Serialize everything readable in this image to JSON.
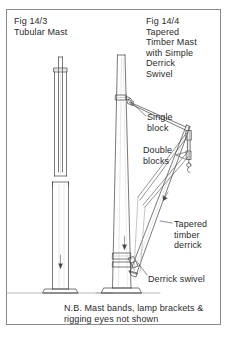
{
  "figure": {
    "border_color": "#8b8b8b",
    "line_color": "#404040",
    "text_color": "#2b2b2b",
    "background": "#ffffff"
  },
  "titles": {
    "left": "Fig 14/3\nTubular Mast",
    "right": "Fig 14/4\nTapered\nTimber Mast\nwith Simple\nDerrick\nSwivel"
  },
  "callouts": {
    "single_block": "Single\nblock",
    "double_blocks": "Double\nblocks",
    "tapered_derrick": "Tapered\ntimber\nderrick",
    "derrick_swivel": "Derrick swivel"
  },
  "note": "N.B. Mast bands, lamp brackets &\nrigging eyes not shown",
  "parts": {
    "tubular_mast": "tubular-mast-drawing",
    "timber_mast": "tapered-timber-mast-drawing",
    "derrick_boom": "tapered-timber-derrick-drawing",
    "single_block": "single-block-drawing",
    "double_blocks": "double-blocks-drawing",
    "swivel": "derrick-swivel-drawing",
    "hook": "cargo-hook-drawing",
    "base_plate": "mast-base-plate-drawing"
  }
}
